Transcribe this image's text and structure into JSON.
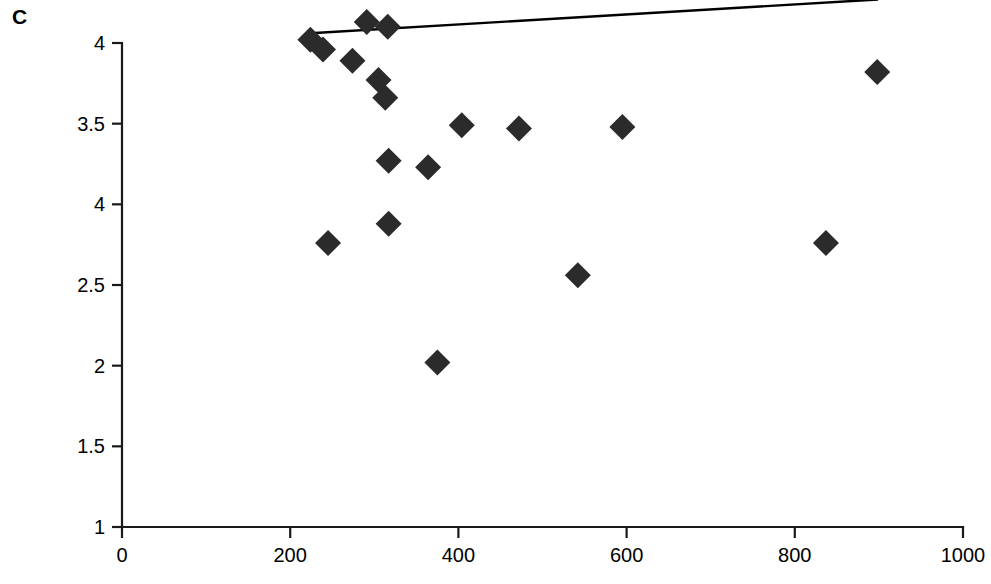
{
  "figure": {
    "panel_label": "C",
    "background_color": "#ffffff",
    "marker_color": "#2b2b2b",
    "axis_color": "#1a1a1a",
    "trend_line_color": "#000000"
  },
  "chart_data": {
    "type": "scatter",
    "title": "",
    "subtitle": "",
    "xlabel": "",
    "ylabel": "",
    "xlim": [
      0,
      1000
    ],
    "ylim": [
      1,
      4
    ],
    "grid": false,
    "legend": false,
    "legend_position": "none",
    "xticks": [
      0,
      200,
      400,
      600,
      800,
      1000
    ],
    "xtick_labels": [
      "0",
      "200",
      "400",
      "600",
      "800",
      "1000"
    ],
    "yticks": [
      1,
      1.5,
      2,
      2.5,
      3,
      3.5,
      4
    ],
    "ytick_labels": [
      "1",
      "1.5",
      "2",
      "2.5",
      "4",
      "3.5",
      "4"
    ],
    "marker_shape": "diamond",
    "points": [
      {
        "x": 224,
        "y": 4.02
      },
      {
        "x": 239,
        "y": 3.96
      },
      {
        "x": 245,
        "y": 2.76
      },
      {
        "x": 274,
        "y": 3.89
      },
      {
        "x": 291,
        "y": 4.13
      },
      {
        "x": 305,
        "y": 3.77
      },
      {
        "x": 313,
        "y": 3.66
      },
      {
        "x": 316,
        "y": 4.1
      },
      {
        "x": 317,
        "y": 3.27
      },
      {
        "x": 317,
        "y": 2.88
      },
      {
        "x": 364,
        "y": 3.23
      },
      {
        "x": 375,
        "y": 2.02
      },
      {
        "x": 404,
        "y": 3.49
      },
      {
        "x": 472,
        "y": 3.47
      },
      {
        "x": 542,
        "y": 2.56
      },
      {
        "x": 595,
        "y": 3.48
      },
      {
        "x": 837,
        "y": 2.76
      },
      {
        "x": 898,
        "y": 3.82
      }
    ],
    "trend_line": {
      "x_start": 224,
      "y_start": 4.06,
      "x_end": 899,
      "y_end": 4.27
    }
  }
}
